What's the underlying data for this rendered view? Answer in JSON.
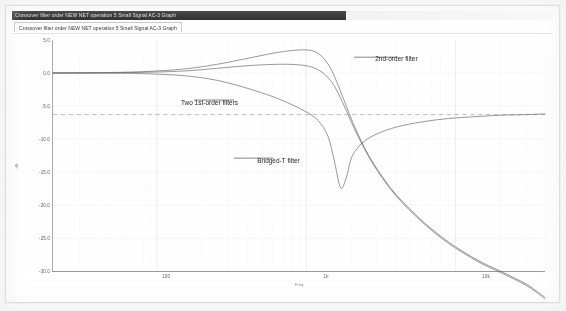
{
  "window": {
    "title": "Crossover filter order NEW NET operation 5 Small Signal AC-3 Graph",
    "tab_label": "Crossover filter order NEW NET operation 5 Small Signal AC-3 Graph"
  },
  "chart_data": {
    "type": "line",
    "title": "",
    "xlabel": "Freq",
    "ylabel": "dB",
    "xscale": "log",
    "xlim": [
      20,
      40000
    ],
    "ylim": [
      -30.0,
      5.0
    ],
    "grid": true,
    "legend": "annotations",
    "x_ticks": [
      {
        "value": 100,
        "label": "100"
      },
      {
        "value": 1000,
        "label": "1k"
      },
      {
        "value": 10000,
        "label": "10k"
      }
    ],
    "y_ticks": [
      {
        "value": 5.0,
        "label": "5.0"
      },
      {
        "value": 0.0,
        "label": "0.0"
      },
      {
        "value": -5.0,
        "label": "-5.0"
      },
      {
        "value": -10.0,
        "label": "-10.0"
      },
      {
        "value": -15.0,
        "label": "-15.0"
      },
      {
        "value": -20.0,
        "label": "-20.0"
      },
      {
        "value": -25.0,
        "label": "-25.0"
      },
      {
        "value": -30.0,
        "label": "-30.0"
      }
    ],
    "reference_line": {
      "value": -6.3,
      "style": "dashed",
      "label": ""
    },
    "series": [
      {
        "name": "2nd-order filter",
        "x": [
          20,
          40,
          80,
          150,
          250,
          400,
          600,
          800,
          1000,
          1150,
          1300,
          1450,
          1600,
          1800,
          2100,
          2500,
          3000,
          4000,
          6000,
          9000,
          14000,
          20000,
          30000,
          40000
        ],
        "y": [
          0.0,
          0.05,
          0.2,
          0.6,
          1.3,
          2.2,
          3.0,
          3.4,
          3.5,
          3.2,
          2.3,
          0.8,
          -1.3,
          -4.2,
          -8.0,
          -11.6,
          -14.6,
          -18.4,
          -22.4,
          -25.6,
          -28.3,
          -30.0,
          -32.0,
          -34.0
        ]
      },
      {
        "name": "Two 1st-order filters",
        "x": [
          20,
          40,
          80,
          150,
          250,
          400,
          600,
          800,
          1000,
          1150,
          1300,
          1450,
          1600,
          1800,
          2100,
          2500,
          3000,
          4000,
          6000,
          9000,
          14000,
          20000,
          30000,
          40000
        ],
        "y": [
          0.0,
          0.0,
          0.1,
          0.3,
          0.7,
          1.1,
          1.3,
          1.3,
          1.1,
          0.7,
          0.0,
          -1.1,
          -2.6,
          -5.0,
          -8.4,
          -11.8,
          -14.8,
          -18.6,
          -22.6,
          -25.8,
          -28.5,
          -30.2,
          -32.2,
          -34.2
        ]
      },
      {
        "name": "Bridged-T filter",
        "x": [
          20,
          40,
          80,
          150,
          250,
          400,
          600,
          800,
          1000,
          1200,
          1400,
          1550,
          1700,
          1850,
          2000,
          2200,
          2500,
          3000,
          4000,
          6000,
          9000,
          14000,
          20000,
          30000,
          40000
        ],
        "y": [
          0.0,
          0.0,
          -0.1,
          -0.4,
          -1.1,
          -2.3,
          -3.6,
          -4.8,
          -5.9,
          -7.2,
          -9.6,
          -13.5,
          -17.4,
          -16.0,
          -13.0,
          -11.4,
          -10.2,
          -9.2,
          -8.2,
          -7.4,
          -6.9,
          -6.6,
          -6.4,
          -6.3,
          -6.2
        ]
      }
    ],
    "annotations": [
      {
        "text": "2nd-order filter",
        "target_series": "2nd-order filter",
        "leader": true
      },
      {
        "text": "Two 1st-order filters",
        "target_series": "Two 1st-order filters",
        "leader": true
      },
      {
        "text": "Bridged-T filter",
        "target_series": "Bridged-T filter",
        "leader": true
      }
    ]
  }
}
